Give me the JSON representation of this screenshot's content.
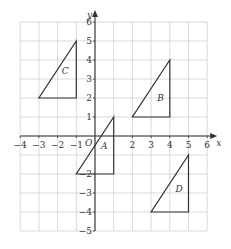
{
  "chart_data": {
    "type": "diagram",
    "title": "",
    "xlabel": "x",
    "ylabel": "y",
    "xlim": [
      -4,
      6
    ],
    "ylim": [
      -5,
      6
    ],
    "grid": true,
    "origin_label": "O",
    "x_ticks": [
      -4,
      -3,
      -2,
      -1,
      2,
      3,
      4,
      5,
      6
    ],
    "y_ticks": [
      6,
      5,
      4,
      3,
      2,
      1,
      -2,
      -3,
      -4,
      -5
    ],
    "shapes": [
      {
        "name": "A",
        "vertices": [
          [
            -1,
            -2
          ],
          [
            1,
            -2
          ],
          [
            1,
            1
          ]
        ],
        "label_pos": [
          0.5,
          -0.5
        ]
      },
      {
        "name": "B",
        "vertices": [
          [
            2,
            1
          ],
          [
            4,
            1
          ],
          [
            4,
            4
          ]
        ],
        "label_pos": [
          3.5,
          2
        ]
      },
      {
        "name": "C",
        "vertices": [
          [
            -3,
            2
          ],
          [
            -1,
            2
          ],
          [
            -1,
            5
          ]
        ],
        "label_pos": [
          -1.6,
          3.4
        ]
      },
      {
        "name": "D",
        "vertices": [
          [
            3,
            -4
          ],
          [
            5,
            -4
          ],
          [
            5,
            -1
          ]
        ],
        "label_pos": [
          4.5,
          -2.8
        ]
      }
    ]
  },
  "colors": {
    "grid": "#cfcfcf",
    "axis": "#333333",
    "shape": "#333333"
  }
}
